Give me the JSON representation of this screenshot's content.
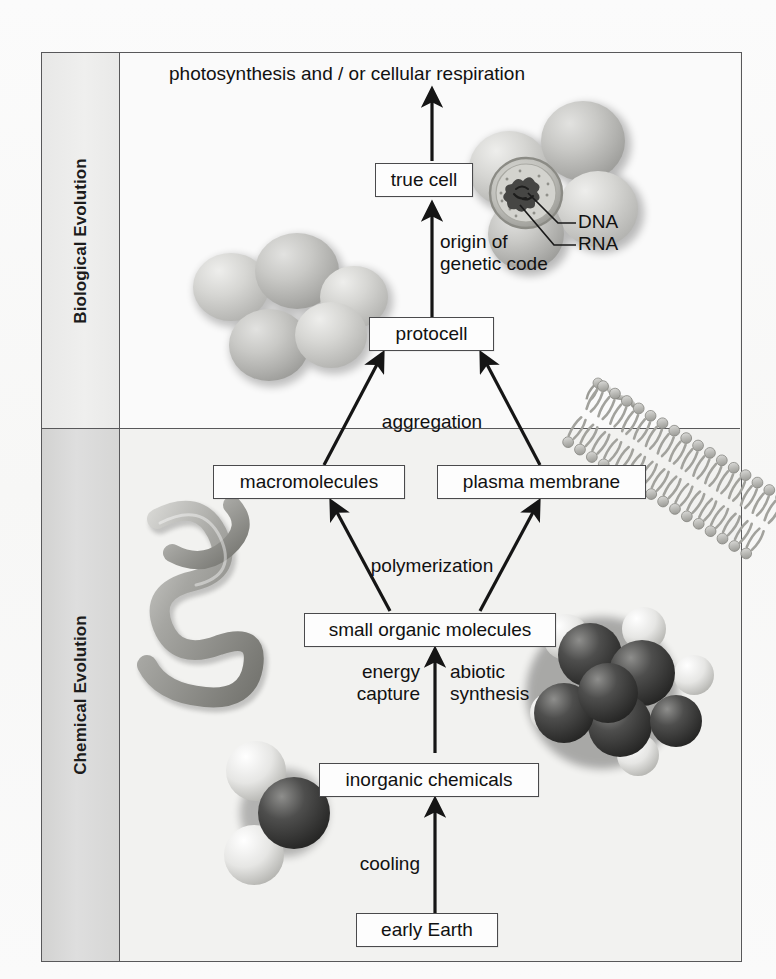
{
  "figure": {
    "title_top": "photosynthesis and / or cellular respiration",
    "sections": [
      {
        "id": "biological",
        "label": "Biological Evolution"
      },
      {
        "id": "chemical",
        "label": "Chemical Evolution"
      }
    ]
  },
  "nodes": [
    {
      "id": "true-cell",
      "label": "true cell"
    },
    {
      "id": "protocell",
      "label": "protocell"
    },
    {
      "id": "macromolecules",
      "label": "macromolecules"
    },
    {
      "id": "plasma-membrane",
      "label": "plasma membrane"
    },
    {
      "id": "small-organic-molecules",
      "label": "small organic molecules"
    },
    {
      "id": "inorganic-chemicals",
      "label": "inorganic chemicals"
    },
    {
      "id": "early-earth",
      "label": "early Earth"
    }
  ],
  "process_labels": [
    {
      "id": "origin-genetic-code",
      "label": "origin of\ngenetic code"
    },
    {
      "id": "aggregation",
      "label": "aggregation"
    },
    {
      "id": "polymerization",
      "label": "polymerization"
    },
    {
      "id": "energy-capture",
      "label": "energy\ncapture"
    },
    {
      "id": "abiotic-synthesis",
      "label": "abiotic\nsynthesis"
    },
    {
      "id": "cooling",
      "label": "cooling"
    }
  ],
  "callouts": [
    {
      "id": "dna",
      "label": "DNA"
    },
    {
      "id": "rna",
      "label": "RNA"
    }
  ],
  "artwork": [
    {
      "id": "cell-cluster-top",
      "name": "cell-cluster-illustration"
    },
    {
      "id": "cell-cluster-middle",
      "name": "protocell-cluster-illustration"
    },
    {
      "id": "protein-coil",
      "name": "macromolecule-protein-illustration"
    },
    {
      "id": "lipid-bilayer",
      "name": "phospholipid-bilayer-illustration"
    },
    {
      "id": "organic-molecule",
      "name": "space-filling-organic-molecule-illustration"
    },
    {
      "id": "water-molecule",
      "name": "space-filling-water-molecule-illustration"
    }
  ],
  "colors": {
    "frame_stroke": "#58585a",
    "box_stroke": "#4a4a4c",
    "box_fill": "#fdfdfd",
    "text": "#111111",
    "panel_bio": "#fafafa",
    "panel_chem": "#f2f2f0",
    "side_bio": "#eaeaea",
    "side_chem": "#d6d6d5",
    "arrow": "#1a1a1a"
  }
}
